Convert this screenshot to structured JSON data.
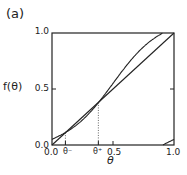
{
  "panel_label": "(a)",
  "chart_data": {
    "type": "line",
    "title": "",
    "xlabel": "θ",
    "ylabel": "f(θ)",
    "xlim": [
      0.0,
      1.0
    ],
    "ylim": [
      0.0,
      1.0
    ],
    "grid": false,
    "x_ticks": [
      "0.0",
      "θ⁻",
      "θ⁺",
      "0.5",
      "1.0"
    ],
    "x_tick_values": [
      0.0,
      0.11,
      0.38,
      0.5,
      1.0
    ],
    "y_ticks": [
      "0.0",
      "0.5",
      "1.0"
    ],
    "annotations": [
      {
        "label": "θ⁻",
        "x": 0.11,
        "y": 0.11,
        "style": "dotted vertical drop line"
      },
      {
        "label": "θ⁺",
        "x": 0.38,
        "y": 0.38,
        "style": "dotted vertical drop line"
      }
    ],
    "series": [
      {
        "name": "identity f(θ)=θ",
        "x": [
          0.0,
          1.0
        ],
        "y": [
          0.0,
          1.0
        ]
      },
      {
        "name": "map f(θ) mod 1",
        "model": "θ + 0.05 − 0.076·sin(2πθ) mod 1",
        "x": [
          0.0,
          0.1,
          0.2,
          0.3,
          0.4,
          0.5,
          0.6,
          0.7,
          0.8,
          0.86,
          0.86,
          0.9,
          1.0
        ],
        "y": [
          0.05,
          0.11,
          0.18,
          0.28,
          0.41,
          0.55,
          0.72,
          0.83,
          0.92,
          1.0,
          0.0,
          0.02,
          0.05
        ]
      }
    ]
  },
  "labels": {
    "y_axis": "f(θ)",
    "x_axis": "θ",
    "y_tick_0": "0.0",
    "y_tick_05": "0.5",
    "y_tick_1": "1.0",
    "x_tick_0": "0.0",
    "x_tick_minus": "θ⁻",
    "x_tick_plus": "θ⁺",
    "x_tick_05": "0.5",
    "x_tick_1": "1.0"
  }
}
